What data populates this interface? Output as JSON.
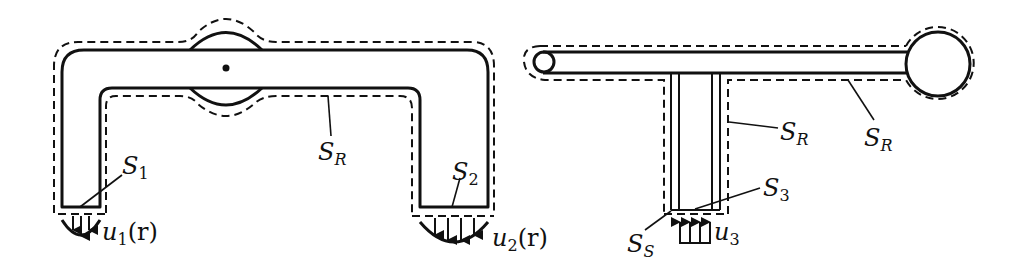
{
  "figure": {
    "left_panel": {
      "description": "U-shaped duct with hinge/rotating section at top center; dashed control surface",
      "labels": {
        "s1": {
          "main": "S",
          "sub": "1"
        },
        "s2": {
          "main": "S",
          "sub": "2"
        },
        "sr": {
          "main": "S",
          "sub": "R"
        },
        "u1": {
          "main": "u",
          "sub": "1",
          "arg": "(r)"
        },
        "u2": {
          "main": "u",
          "sub": "2",
          "arg": "(r)"
        }
      }
    },
    "right_panel": {
      "description": "Lawn sprinkler style T-arm with vertical inlet pipe; dashed control surface",
      "labels": {
        "sr_left": {
          "main": "S",
          "sub": "R"
        },
        "sr_right": {
          "main": "S",
          "sub": "R"
        },
        "s3": {
          "main": "S",
          "sub": "3"
        },
        "ss": {
          "main": "S",
          "sub": "S"
        },
        "u3": {
          "main": "u",
          "sub": "3"
        }
      }
    }
  }
}
